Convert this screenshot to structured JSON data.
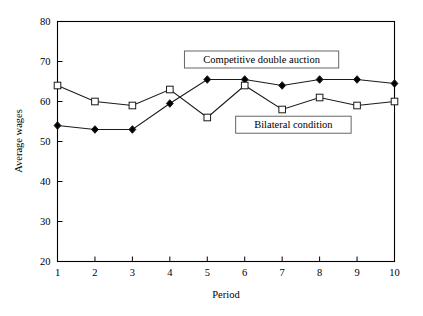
{
  "chart_data": {
    "type": "line",
    "title": "",
    "xlabel": "Period",
    "ylabel": "Average wages",
    "x": [
      1,
      2,
      3,
      4,
      5,
      6,
      7,
      8,
      9,
      10
    ],
    "xtick_labels": [
      "1",
      "2",
      "3",
      "4",
      "5",
      "6",
      "7",
      "8",
      "9",
      "10"
    ],
    "ytick_labels": [
      "20",
      "30",
      "40",
      "50",
      "60",
      "70",
      "80"
    ],
    "yticks": [
      20,
      30,
      40,
      50,
      60,
      70,
      80
    ],
    "xlim": [
      1,
      10
    ],
    "ylim": [
      20,
      80
    ],
    "grid": false,
    "legend_position": "inside-plot-annotations",
    "series": [
      {
        "name": "Competitive double auction",
        "marker": "filled-diamond",
        "values": [
          54,
          53,
          53,
          59.5,
          65.5,
          65.5,
          64,
          65.5,
          65.5,
          64.5
        ]
      },
      {
        "name": "Bilateral condition",
        "marker": "open-square",
        "values": [
          64,
          60,
          59,
          63,
          56,
          64,
          58,
          61,
          59,
          60
        ]
      }
    ],
    "annotations": [
      {
        "text": "Competitive double auction",
        "x": 6.45,
        "y": 70.5
      },
      {
        "text": "Bilateral condition",
        "x": 7.3,
        "y": 54.2
      }
    ],
    "colors": {
      "line": "#1a1a1a",
      "axis": "#000000",
      "background": "#ffffff",
      "marker_fill_open": "#ffffff",
      "marker_fill_solid": "#000000"
    }
  }
}
